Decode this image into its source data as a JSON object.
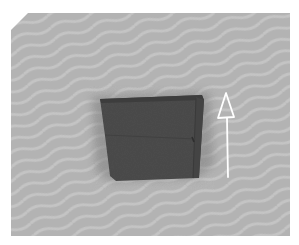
{
  "image": {
    "description": "Folded dark gray cloth on a gray surface with a white hand-drawn upward arrow to its right",
    "colors": {
      "background": "#ffffff",
      "surface": "#b2b2b2",
      "surface_stripe": "#c2c2c2",
      "cloth": "#4a4a4a",
      "cloth_edge": "#3a3a3a",
      "shadow": "#8e8e8e",
      "arrow": "#ffffff"
    },
    "objects": [
      {
        "name": "gray-surface"
      },
      {
        "name": "folded-cloth"
      },
      {
        "name": "up-arrow-annotation",
        "direction": "up"
      }
    ]
  }
}
